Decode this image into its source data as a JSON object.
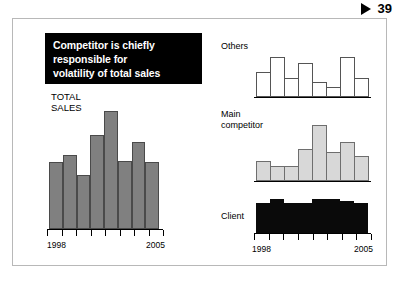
{
  "page_marker": {
    "icon": "play-triangle-icon",
    "number": "39"
  },
  "title_block": {
    "lines": [
      "Competitor is chiefly",
      "responsible for",
      "volatility of total sales"
    ],
    "background_color": "#000000",
    "text_color": "#ffffff"
  },
  "colors": {
    "total_sales_bar": "#808080",
    "others_bar": "#ffffff",
    "main_competitor_bar": "#d8d8d8",
    "client_bar": "#0a0a0a",
    "frame_border": "#b8b8b8"
  },
  "chart_data": [
    {
      "type": "bar",
      "title": "TOTAL SALES",
      "name": "total-sales",
      "categories": [
        "1998",
        "1999",
        "2000",
        "2001",
        "2002",
        "2003",
        "2004",
        "2005"
      ],
      "values": [
        57,
        63,
        46,
        80,
        100,
        58,
        74,
        57
      ],
      "xlabel": "",
      "ylabel": "",
      "ylim": [
        0,
        100
      ],
      "tick_labels_shown": [
        "1998",
        "2005"
      ],
      "grid": false,
      "legend": "none",
      "bar_color": "#808080"
    },
    {
      "type": "bar",
      "title": "Others",
      "name": "others",
      "categories": [
        "1998",
        "1999",
        "2000",
        "2001",
        "2002",
        "2003",
        "2004",
        "2005"
      ],
      "values": [
        55,
        88,
        42,
        74,
        32,
        22,
        88,
        42
      ],
      "xlabel": "",
      "ylabel": "",
      "ylim": [
        0,
        100
      ],
      "tick_labels_shown": [],
      "grid": false,
      "legend": "none",
      "bar_color": "#ffffff"
    },
    {
      "type": "bar",
      "title": "Main competitor",
      "name": "main-competitor",
      "categories": [
        "1998",
        "1999",
        "2000",
        "2001",
        "2002",
        "2003",
        "2004",
        "2005"
      ],
      "values": [
        36,
        26,
        27,
        57,
        100,
        52,
        70,
        45
      ],
      "xlabel": "",
      "ylabel": "",
      "ylim": [
        0,
        100
      ],
      "tick_labels_shown": [],
      "grid": false,
      "legend": "none",
      "bar_color": "#d8d8d8"
    },
    {
      "type": "bar",
      "title": "Client",
      "name": "client",
      "categories": [
        "1998",
        "1999",
        "2000",
        "2001",
        "2002",
        "2003",
        "2004",
        "2005"
      ],
      "values": [
        88,
        100,
        88,
        88,
        100,
        100,
        94,
        88
      ],
      "xlabel": "",
      "ylabel": "",
      "ylim": [
        0,
        100
      ],
      "tick_labels_shown": [
        "1998",
        "2005"
      ],
      "grid": false,
      "legend": "none",
      "bar_color": "#0a0a0a"
    }
  ]
}
